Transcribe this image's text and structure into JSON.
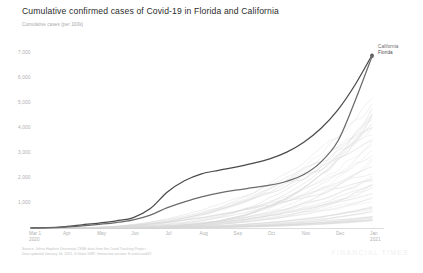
{
  "title": "Cumulative confirmed cases of Covid-19 in Florida and California",
  "subtitle": "Cumulative cases (per 100k)",
  "source_line1": "Source: Johns Hopkins University CSSE data from the Covid Tracking Project",
  "source_line2": "Data updated January 16, 2021, 6:10am GMT. Interactive version: ft.com/covid19",
  "watermark": "FINANCIAL TIMES",
  "legend": {
    "items": [
      {
        "name": "California",
        "color": "#6b6b6b"
      },
      {
        "name": "Florida",
        "color": "#4a4a4a"
      }
    ]
  },
  "chart_data": {
    "type": "line",
    "title": "Cumulative confirmed cases of Covid-19 in Florida and California",
    "subtitle": "Cumulative cases (per 100k)",
    "xlabel": "",
    "ylabel": "Cumulative cases (per 100k)",
    "grid": false,
    "legend_position": "right-top",
    "x_tick_labels": [
      "Mar 1",
      "Apr",
      "May",
      "Jun",
      "Jul",
      "Aug",
      "Sep",
      "Oct",
      "Nov",
      "Dec",
      "Jan"
    ],
    "x_tick_sublabels": [
      "2020",
      "",
      "",
      "",
      "",
      "",
      "",
      "",
      "",
      "",
      "2021"
    ],
    "y_tick_labels": [
      "1,000",
      "2,000",
      "3,000",
      "4,000",
      "5,000",
      "6,000",
      "7,000"
    ],
    "y_tick_values": [
      1000,
      2000,
      3000,
      4000,
      5000,
      6000,
      7000
    ],
    "ylim": [
      0,
      7400
    ],
    "xlim": [
      0,
      10
    ],
    "series": [
      {
        "name": "Florida",
        "color": "#4a4a4a",
        "highlighted": true,
        "x": [
          0,
          0.5,
          1,
          1.5,
          2,
          2.5,
          3,
          3.5,
          4,
          4.5,
          5,
          5.5,
          6,
          6.5,
          7,
          7.5,
          8,
          8.5,
          9,
          9.5,
          10
        ],
        "values": [
          2,
          15,
          60,
          130,
          200,
          290,
          420,
          780,
          1450,
          1900,
          2180,
          2320,
          2450,
          2600,
          2780,
          3050,
          3450,
          4000,
          4750,
          5750,
          6950
        ]
      },
      {
        "name": "California",
        "color": "#6b6b6b",
        "highlighted": true,
        "x": [
          0,
          0.5,
          1,
          1.5,
          2,
          2.5,
          3,
          3.5,
          4,
          4.5,
          5,
          5.5,
          6,
          6.5,
          7,
          7.5,
          8,
          8.5,
          9,
          9.5,
          10
        ],
        "values": [
          1,
          10,
          40,
          90,
          150,
          220,
          330,
          520,
          820,
          1050,
          1250,
          1400,
          1520,
          1620,
          1720,
          1880,
          2150,
          2650,
          3500,
          5100,
          6900
        ]
      }
    ],
    "background_series_count": 52,
    "background_series_note": "Faint grey lines show all other US states",
    "annotations": [
      {
        "label": "California",
        "x": 10,
        "y": 6900
      },
      {
        "label": "Florida",
        "x": 10,
        "y": 6950
      }
    ]
  }
}
